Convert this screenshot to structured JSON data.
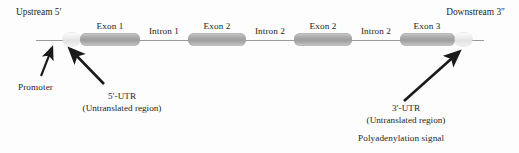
{
  "figure": {
    "title_absent": true,
    "upstream_label": "Upstream 5′",
    "downstream_label": "Downstream 3″"
  },
  "segments": [
    {
      "id": "utr5",
      "kind": "utr",
      "label": "",
      "x": 63,
      "width": 17
    },
    {
      "id": "exon1",
      "kind": "exon",
      "label": "Exon 1",
      "x": 80,
      "width": 60
    },
    {
      "id": "intron1",
      "kind": "line",
      "label": "Intron 1",
      "x": 140,
      "width": 48
    },
    {
      "id": "exon2a",
      "kind": "exon",
      "label": "Exon 2",
      "x": 188,
      "width": 58
    },
    {
      "id": "intron2a",
      "kind": "line",
      "label": "Intron 2",
      "x": 246,
      "width": 48
    },
    {
      "id": "exon2b",
      "kind": "exon",
      "label": "Exon 2",
      "x": 294,
      "width": 58
    },
    {
      "id": "intron2b",
      "kind": "line",
      "label": "Intron 2",
      "x": 352,
      "width": 48
    },
    {
      "id": "exon3",
      "kind": "exon",
      "label": "Exon 3",
      "x": 400,
      "width": 55
    },
    {
      "id": "utr3",
      "kind": "utr",
      "label": "",
      "x": 455,
      "width": 17
    }
  ],
  "callouts": {
    "promoter": "Promoter",
    "utr5_line1": "5′-UTR",
    "utr5_line2": "(Untranslated region)",
    "utr3_line1": "3′-UTR",
    "utr3_line2": "(Untranslated region)",
    "polya": "Polyadenylation signal"
  },
  "colors": {
    "background": "#fdfdfd",
    "backbone": "#9a9a9a",
    "exon_fill": "#a8a8a8",
    "utr_fill": "#eeeeee",
    "text": "#1f1f1f",
    "arrow": "#1a1a1a"
  }
}
